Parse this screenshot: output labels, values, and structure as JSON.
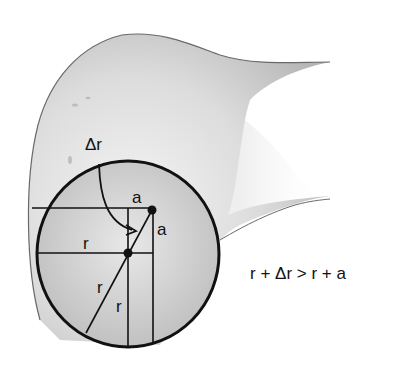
{
  "figure": {
    "labels": {
      "delta_r": "Δr",
      "a_top": "a",
      "a_side": "a",
      "r_horizontal": "r",
      "r_diagonal": "r",
      "r_vertical": "r"
    },
    "equation": "r + Δr > r + a",
    "colors": {
      "ink": "#111111",
      "bone_shade_dark": "#9a9a9a",
      "bone_shade_light": "#e6e6e6",
      "background": "#ffffff"
    }
  }
}
